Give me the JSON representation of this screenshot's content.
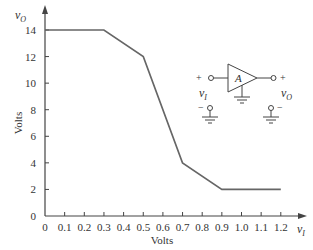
{
  "chart_data": {
    "type": "line",
    "title": "",
    "xlabel": "Volts",
    "ylabel": "Volts",
    "x_axis_var": "v",
    "x_axis_var_sub": "I",
    "y_axis_var": "v",
    "y_axis_var_sub": "O",
    "xlim": [
      0,
      1.2
    ],
    "ylim": [
      0,
      14
    ],
    "xticks": [
      "0",
      "0.1",
      "0.2",
      "0.3",
      "0.4",
      "0.5",
      "0.6",
      "0.7",
      "0.8",
      "0.9",
      "1.0",
      "1.1",
      "1.2"
    ],
    "yticks": [
      "0",
      "2",
      "4",
      "6",
      "8",
      "10",
      "12",
      "14"
    ],
    "grid": false,
    "series": [
      {
        "name": "vO vs vI",
        "x": [
          0,
          0.3,
          0.5,
          0.7,
          0.9,
          1.2
        ],
        "y": [
          14,
          14,
          12,
          4,
          2,
          2
        ]
      }
    ],
    "color": "#666666"
  },
  "inset": {
    "amplifier_label": "A",
    "input_plus": "+",
    "input_minus": "−",
    "output_plus": "+",
    "output_minus": "−",
    "input_var": "v",
    "input_var_sub": "I",
    "output_var": "v",
    "output_var_sub": "O"
  }
}
